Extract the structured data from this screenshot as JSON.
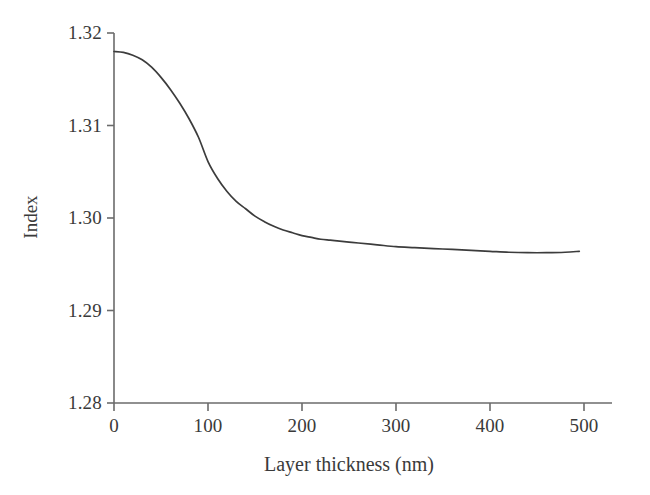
{
  "chart_data": {
    "type": "line",
    "title": "",
    "subtitle": "",
    "xlabel": "Layer thickness (nm)",
    "ylabel": "Index",
    "xlim": [
      0,
      500
    ],
    "ylim": [
      1.28,
      1.32
    ],
    "xticks": [
      0,
      100,
      200,
      300,
      400,
      500
    ],
    "yticks": [
      1.28,
      1.29,
      1.3,
      1.31,
      1.32
    ],
    "xtick_labels": [
      "0",
      "100",
      "200",
      "300",
      "400",
      "500"
    ],
    "ytick_labels": [
      "1.28",
      "1.29",
      "1.30",
      "1.31",
      "1.32"
    ],
    "grid": false,
    "legend": "none",
    "axis_style": "left-and-bottom-spines",
    "line_color": "#3c3c3c",
    "line_width": 1.7,
    "series": [
      {
        "name": "Index vs layer thickness",
        "x": [
          0,
          10,
          20,
          30,
          40,
          50,
          60,
          70,
          80,
          90,
          100,
          110,
          120,
          130,
          140,
          150,
          160,
          170,
          180,
          190,
          200,
          210,
          220,
          230,
          240,
          250,
          260,
          280,
          300,
          320,
          340,
          360,
          380,
          400,
          420,
          440,
          460,
          480,
          495
        ],
        "y": [
          1.318,
          1.3179,
          1.3176,
          1.3171,
          1.3163,
          1.3152,
          1.3139,
          1.3124,
          1.3107,
          1.3087,
          1.3061,
          1.3043,
          1.3029,
          1.3018,
          1.301,
          1.3002,
          1.2996,
          1.2991,
          1.2987,
          1.2984,
          1.2981,
          1.2979,
          1.2977,
          1.2976,
          1.2975,
          1.2974,
          1.2973,
          1.2971,
          1.2969,
          1.2968,
          1.2967,
          1.2966,
          1.2965,
          1.2964,
          1.2963,
          1.29625,
          1.29625,
          1.2963,
          1.2964
        ]
      }
    ]
  },
  "axes": {
    "y_axis_title": "Index",
    "x_axis_title": "Layer thickness (nm)"
  }
}
